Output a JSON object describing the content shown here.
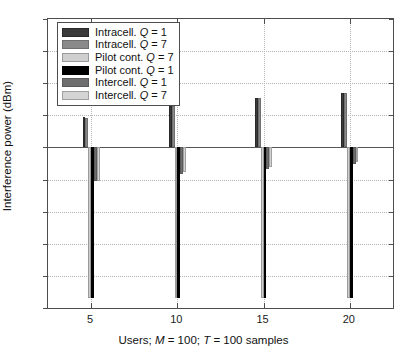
{
  "chart_data": {
    "type": "bar",
    "title": "",
    "xlabel": "Users; M = 100; T = 100 samples",
    "ylabel": "Interference power (dBm)",
    "categories": [
      "5",
      "10",
      "15",
      "20"
    ],
    "xticks": [
      5,
      10,
      15,
      20
    ],
    "ylim": [
      -50,
      40
    ],
    "yticks": [
      40,
      30,
      20,
      10,
      0,
      -10,
      -20,
      -30,
      -40,
      -50
    ],
    "grid": true,
    "legend_position": "upper-left",
    "series": [
      {
        "name": "Intracell. Q = 1",
        "label_prefix": "Intracell.",
        "q": "1",
        "color": "#3a3a3a",
        "edge": "#2a2a2a",
        "values": [
          9.5,
          13.0,
          15.5,
          17.0
        ]
      },
      {
        "name": "Intracell. Q = 7",
        "label_prefix": "Intracell.",
        "q": "7",
        "color": "#8a8a8a",
        "edge": "#6f6f6f",
        "values": [
          9.3,
          12.8,
          15.3,
          16.8
        ]
      },
      {
        "name": "Pilot cont. Q = 7",
        "label_prefix": "Pilot cont.",
        "q": "7",
        "color": "#cfcfcf",
        "edge": "#9a9a9a",
        "values": [
          -47.0,
          -47.0,
          -47.0,
          -47.0
        ]
      },
      {
        "name": "Pilot cont. Q = 1",
        "label_prefix": "Pilot cont.",
        "q": "1",
        "color": "#000000",
        "edge": "#000000",
        "values": [
          -47.0,
          -47.0,
          -47.0,
          -47.0
        ]
      },
      {
        "name": "Intercell. Q = 1",
        "label_prefix": "Intercell.",
        "q": "1",
        "color": "#6e6e6e",
        "edge": "#5a5a5a",
        "values": [
          -10.6,
          -8.2,
          -6.6,
          -5.2
        ]
      },
      {
        "name": "Intercell. Q = 7",
        "label_prefix": "Intercell.",
        "q": "7",
        "color": "#d4d4d4",
        "edge": "#a0a0a0",
        "values": [
          -10.4,
          -7.6,
          -6.0,
          -4.6
        ]
      }
    ],
    "draw_order": [
      {
        "series": 5,
        "group": 0
      },
      {
        "series": 4,
        "group": 0
      },
      {
        "series": 3,
        "group": 0
      },
      {
        "series": 2,
        "group": 0
      },
      {
        "series": 1,
        "group": 0
      },
      {
        "series": 0,
        "group": 0
      },
      {
        "series": 5,
        "group": 1
      },
      {
        "series": 4,
        "group": 1
      },
      {
        "series": 3,
        "group": 1
      },
      {
        "series": 2,
        "group": 1
      },
      {
        "series": 1,
        "group": 1
      },
      {
        "series": 0,
        "group": 1
      },
      {
        "series": 5,
        "group": 2
      },
      {
        "series": 4,
        "group": 2
      },
      {
        "series": 3,
        "group": 2
      },
      {
        "series": 2,
        "group": 2
      },
      {
        "series": 1,
        "group": 2
      },
      {
        "series": 0,
        "group": 2
      },
      {
        "series": 5,
        "group": 3
      },
      {
        "series": 4,
        "group": 3
      },
      {
        "series": 3,
        "group": 3
      },
      {
        "series": 2,
        "group": 3
      },
      {
        "series": 1,
        "group": 3
      },
      {
        "series": 0,
        "group": 3
      }
    ]
  },
  "legend": {
    "items": [
      {
        "label": "Intracell. ",
        "var": "Q",
        "eq": " = 1"
      },
      {
        "label": "Intracell. ",
        "var": "Q",
        "eq": " = 7"
      },
      {
        "label": "Pilot cont. ",
        "var": "Q",
        "eq": " = 7"
      },
      {
        "label": "Pilot cont. ",
        "var": "Q",
        "eq": " = 1"
      },
      {
        "label": "Intercell. ",
        "var": "Q",
        "eq": " = 1"
      },
      {
        "label": "Intercell. ",
        "var": "Q",
        "eq": " = 7"
      }
    ]
  },
  "axis": {
    "ylabel": "Interference power (dBm)",
    "xlabel_parts": {
      "pre": "Users; ",
      "m": "M",
      "m_val": " = 100; ",
      "t": "T",
      "t_val": " = 100 samples"
    },
    "ytick_labels": [
      "40",
      "30",
      "20",
      "10",
      "0",
      "-10",
      "-20",
      "-30",
      "-40",
      "-50"
    ],
    "xtick_labels": [
      "5",
      "10",
      "15",
      "20"
    ]
  }
}
